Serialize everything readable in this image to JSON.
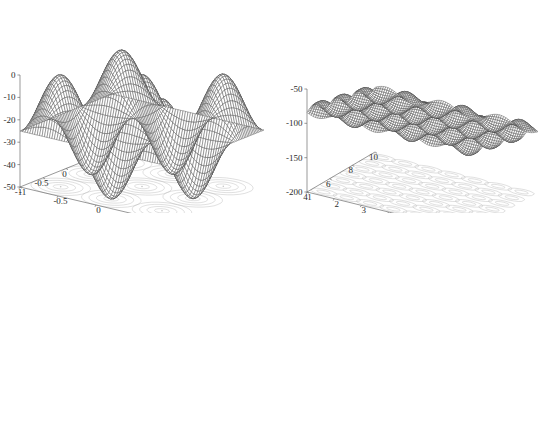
{
  "figure": {
    "background_color": "#ffffff",
    "mesh_color": "#3a3a3a",
    "contour_color": "#b9b9b9",
    "axis_color": "#6d6d6d",
    "label_color": "#2b2b2b",
    "layout": {
      "rows": 2,
      "cols": 2
    }
  },
  "chart_data": [
    {
      "id": "plot-top-left",
      "type": "surface",
      "title": "",
      "xlabel": "",
      "ylabel": "",
      "zlabel": "",
      "xlim": [
        -1,
        1
      ],
      "ylim": [
        -1,
        1
      ],
      "zlim": [
        -50,
        0
      ],
      "xticks": [
        1,
        0.5,
        0,
        -0.5,
        -1
      ],
      "xtick_labels": [
        "1",
        "0.5",
        "0",
        "-0.5",
        "-1"
      ],
      "yticks": [
        -1,
        -0.5,
        0,
        0.5,
        1
      ],
      "ytick_labels": [
        "-1",
        "-0.5",
        "0",
        "0.5",
        "1"
      ],
      "zticks": [
        0,
        -10,
        -20,
        -30,
        -40,
        -50
      ],
      "ztick_labels": [
        "0",
        "-10",
        "-20",
        "-30",
        "-40",
        "-50"
      ],
      "grid": false,
      "contour_projection": true,
      "contour_style": "concentric-ovals",
      "contour_peaks": 9,
      "surface": {
        "kind": "cosine-lattice",
        "amplitude": 25,
        "offset": -25,
        "freq_x": 3.0,
        "freq_y": 3.0,
        "envelope": "none"
      },
      "view": {
        "azimuth": -37.5,
        "elevation": 30
      }
    },
    {
      "id": "plot-top-right",
      "type": "surface",
      "title": "",
      "xlabel": "",
      "ylabel": "",
      "zlabel": "",
      "xlim": [
        4,
        10
      ],
      "ylim": [
        1,
        7
      ],
      "zlim": [
        -200,
        -50
      ],
      "xticks": [
        10,
        8,
        6,
        4
      ],
      "xtick_labels": [
        "10",
        "8",
        "6",
        "4"
      ],
      "yticks": [
        1,
        2,
        3,
        4,
        5,
        6,
        7
      ],
      "ytick_labels": [
        "1",
        "2",
        "3",
        "4",
        "5",
        "6",
        "7"
      ],
      "zticks": [
        -50,
        -100,
        -150,
        -200
      ],
      "ztick_labels": [
        "-50",
        "-100",
        "-150",
        "-200"
      ],
      "grid": false,
      "contour_projection": true,
      "contour_style": "dense-rectangular-grid",
      "contour_peaks": 36,
      "surface": {
        "kind": "ripple-sheet",
        "amplitude": 14,
        "offset": -95,
        "freq_x": 10.0,
        "freq_y": 9.0,
        "tilt": -28,
        "envelope": "linear-tilt"
      },
      "view": {
        "azimuth": -37.5,
        "elevation": 22
      }
    },
    {
      "id": "plot-bottom-left",
      "type": "surface",
      "title": "",
      "xlabel": "",
      "ylabel": "",
      "zlabel": "",
      "xlim": [
        -5,
        5
      ],
      "ylim": [
        -5,
        5
      ],
      "zlim": [
        -100,
        0
      ],
      "xticks": [
        5,
        0,
        -5
      ],
      "xtick_labels": [
        "5",
        "0",
        "-5"
      ],
      "yticks": [
        -5,
        0,
        5
      ],
      "ytick_labels": [
        "-5",
        "0",
        "5"
      ],
      "zticks": [
        0,
        -20,
        -40,
        -60,
        -80,
        -100
      ],
      "ztick_labels": [
        "0",
        "-20",
        "-40",
        "-60",
        "-80",
        "-100"
      ],
      "grid": false,
      "contour_projection": true,
      "contour_style": "dense-rectangular-grid",
      "contour_peaks": 81,
      "surface": {
        "kind": "radial-dome-ripple",
        "amplitude": 22,
        "offset": -40,
        "freq_x": 16.0,
        "freq_y": 16.0,
        "envelope": "radial-dome"
      },
      "view": {
        "azimuth": -37.5,
        "elevation": 26
      }
    },
    {
      "id": "plot-bottom-right",
      "type": "surface",
      "title": "",
      "xlabel": "",
      "ylabel": "",
      "zlabel": "",
      "xlim": [
        -5,
        -3
      ],
      "ylim": [
        3,
        5
      ],
      "zlim": [
        -80,
        -20
      ],
      "xticks": [
        -3,
        -3.5,
        -4,
        -4.5,
        -5
      ],
      "xtick_labels": [
        "-3",
        "-3.5",
        "-4",
        "-4.5",
        "-5"
      ],
      "yticks": [
        3,
        3.5,
        4,
        4.5,
        5
      ],
      "ytick_labels": [
        "3",
        "3.5",
        "4",
        "4.5",
        "5"
      ],
      "zticks": [
        -20,
        -30,
        -40,
        -50,
        -60,
        -70,
        -80
      ],
      "ztick_labels": [
        "-20",
        "-30",
        "-40",
        "-50",
        "-60",
        "-70",
        "-80"
      ],
      "grid": false,
      "contour_projection": true,
      "contour_style": "concentric-ovals",
      "contour_peaks": 9,
      "surface": {
        "kind": "cosine-lattice",
        "amplitude": 22,
        "offset": -48,
        "freq_x": 3.0,
        "freq_y": 3.0,
        "envelope": "none"
      },
      "view": {
        "azimuth": -37.5,
        "elevation": 26
      }
    }
  ]
}
